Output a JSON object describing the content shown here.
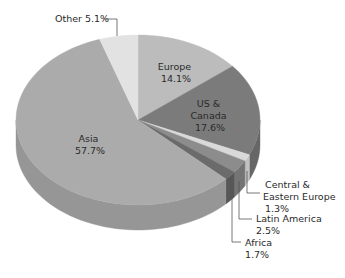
{
  "chart_data": {
    "type": "pie",
    "style": "3d",
    "title": "",
    "start_angle_deg": 0,
    "direction": "clockwise",
    "slices": [
      {
        "label": "Europe",
        "value": 14.1,
        "display": "14.1%",
        "color": "#bcbcbc",
        "side": "#a4a4a4"
      },
      {
        "label": "US & Canada",
        "value": 17.6,
        "display": "17.6%",
        "color": "#7b7b7b",
        "side": "#666666"
      },
      {
        "label": "Central & Eastern Europe",
        "value": 1.3,
        "display": "1.3%",
        "color": "#d9d9d9",
        "side": "#c2c2c2"
      },
      {
        "label": "Latin America",
        "value": 2.5,
        "display": "2.5%",
        "color": "#8c8c8c",
        "side": "#747474"
      },
      {
        "label": "Africa",
        "value": 1.7,
        "display": "1.7%",
        "color": "#6b6b6b",
        "side": "#575757"
      },
      {
        "label": "Asia",
        "value": 57.7,
        "display": "57.7%",
        "color": "#ababab",
        "side": "#969696"
      },
      {
        "label": "Other",
        "value": 5.1,
        "display": "5.1%",
        "color": "#e2e2e2",
        "side": "#cdcdcd"
      }
    ],
    "labels": {
      "europe": [
        "Europe",
        "14.1%"
      ],
      "us_canada": [
        "US &",
        "Canada",
        "17.6%"
      ],
      "asia": [
        "Asia",
        "57.7%"
      ],
      "other": "Other 5.1%",
      "central_eastern_europe": [
        "Central &",
        "Eastern Europe",
        "1.3%"
      ],
      "latin_america": [
        "Latin America",
        "2.5%"
      ],
      "africa": [
        "Africa",
        "1.7%"
      ]
    },
    "legend": "none"
  }
}
